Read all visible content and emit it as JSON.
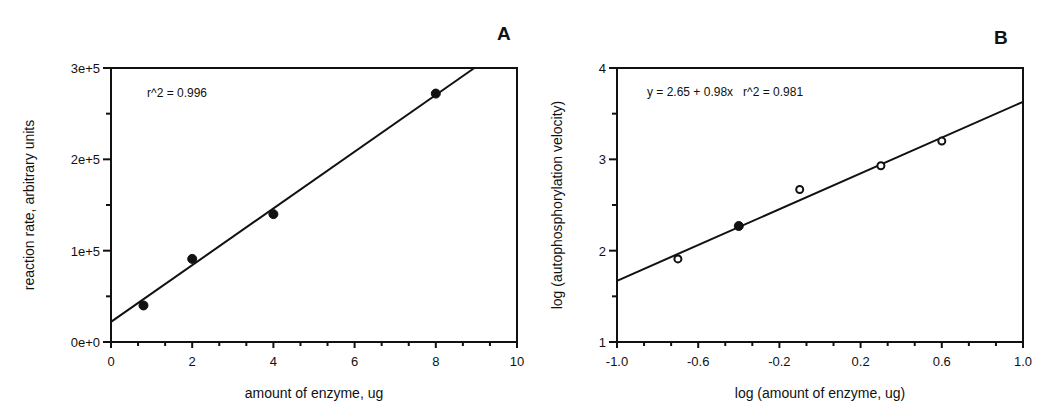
{
  "chart_data": [
    {
      "panel": "A",
      "type": "scatter",
      "xlabel": "amount of enzyme, ug",
      "ylabel": "reaction rate, arbitrary units",
      "xlim": [
        0,
        10
      ],
      "ylim": [
        0,
        300000
      ],
      "x_ticks": [
        0,
        2,
        4,
        6,
        8,
        10
      ],
      "x_tick_labels": [
        "0",
        "2",
        "4",
        "6",
        "8",
        "10"
      ],
      "y_ticks": [
        0,
        100000,
        200000,
        300000
      ],
      "y_tick_labels": [
        "0e+0",
        "1e+5",
        "2e+5",
        "3e+5"
      ],
      "grid": false,
      "annotation": "r^2 = 0.996",
      "series": [
        {
          "name": "measured",
          "marker": "filled-circle",
          "x": [
            0.8,
            2.0,
            4.0,
            8.0
          ],
          "y": [
            40000,
            91000,
            140000,
            272000
          ]
        }
      ],
      "fit_line": {
        "x": [
          0,
          8.95
        ],
        "y": [
          22000,
          300000
        ]
      }
    },
    {
      "panel": "B",
      "type": "scatter",
      "xlabel": "log (amount of enzyme, ug)",
      "ylabel": "log (autophosphorylation velocity)",
      "xlim": [
        -1.0,
        1.0
      ],
      "ylim": [
        1,
        4
      ],
      "x_ticks": [
        -1.0,
        -0.6,
        -0.2,
        0.2,
        0.6,
        1.0
      ],
      "x_tick_labels": [
        "-1.0",
        "-0.6",
        "-0.2",
        "0.2",
        "0.6",
        "1.0"
      ],
      "y_ticks": [
        1,
        2,
        3,
        4
      ],
      "y_tick_labels": [
        "1",
        "2",
        "3",
        "4"
      ],
      "grid": false,
      "annotation": "y = 2.65 + 0.98x   r^2 = 0.981",
      "series": [
        {
          "name": "open",
          "marker": "open-circle",
          "x": [
            -0.7,
            -0.1,
            0.3,
            0.6
          ],
          "y": [
            1.91,
            2.67,
            2.93,
            3.2
          ]
        },
        {
          "name": "filled",
          "marker": "filled-circle",
          "x": [
            -0.4
          ],
          "y": [
            2.27
          ]
        }
      ],
      "fit_line": {
        "x": [
          -1.0,
          1.0
        ],
        "y": [
          1.67,
          3.63
        ]
      }
    }
  ]
}
